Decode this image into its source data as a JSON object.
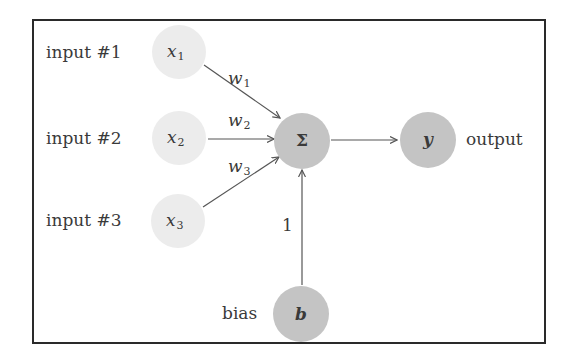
{
  "diagram": {
    "title": "",
    "type": "perceptron",
    "colors": {
      "input_node": "#ececec",
      "core_node": "#c4c4c4",
      "edge": "#555555",
      "border": "#2a2a2a",
      "text": "#3a3a3a"
    },
    "inputs": [
      {
        "label": "input #1",
        "symbol": "x",
        "subscript": "1",
        "weight": "w",
        "weight_sub": "1"
      },
      {
        "label": "input #2",
        "symbol": "x",
        "subscript": "2",
        "weight": "w",
        "weight_sub": "2"
      },
      {
        "label": "input #3",
        "symbol": "x",
        "subscript": "3",
        "weight": "w",
        "weight_sub": "3"
      }
    ],
    "sum_node": {
      "symbol": "Σ"
    },
    "output_node": {
      "symbol": "y",
      "label": "output"
    },
    "bias_node": {
      "symbol": "b",
      "label": "bias",
      "weight": "1"
    }
  }
}
